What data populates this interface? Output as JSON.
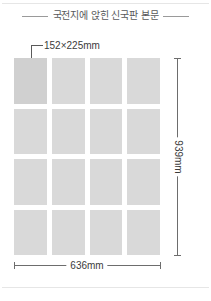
{
  "figure": {
    "title": "국전지에 앉힌 신국판 본문",
    "callout_label": "152×225mm",
    "width_label": "636mm",
    "height_label": "939mm",
    "colors": {
      "page_fill": "#d9d9d9",
      "page_fill_highlight": "#d0d0d0",
      "rule": "#9a9a9a",
      "dimension_line": "#6d6d6d",
      "leader_line": "#5a5a5a",
      "marker_dot": "#333333",
      "title_text": "#58595b",
      "label_text": "#3b3b3b",
      "background": "#ffffff"
    },
    "grid": {
      "columns": 4,
      "rows": 4,
      "total_pages": 16,
      "highlighted_index": 0,
      "cells": [
        {
          "index": 0,
          "highlighted": true
        },
        {
          "index": 1,
          "highlighted": false
        },
        {
          "index": 2,
          "highlighted": false
        },
        {
          "index": 3,
          "highlighted": false
        },
        {
          "index": 4,
          "highlighted": false
        },
        {
          "index": 5,
          "highlighted": false
        },
        {
          "index": 6,
          "highlighted": false
        },
        {
          "index": 7,
          "highlighted": false
        },
        {
          "index": 8,
          "highlighted": false
        },
        {
          "index": 9,
          "highlighted": false
        },
        {
          "index": 10,
          "highlighted": false
        },
        {
          "index": 11,
          "highlighted": false
        },
        {
          "index": 12,
          "highlighted": false
        },
        {
          "index": 13,
          "highlighted": false
        },
        {
          "index": 14,
          "highlighted": false
        },
        {
          "index": 15,
          "highlighted": false
        }
      ]
    }
  }
}
